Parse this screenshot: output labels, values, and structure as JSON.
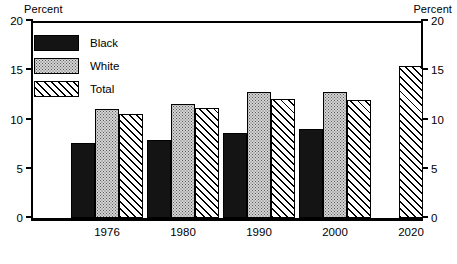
{
  "axis": {
    "left_caption": "Percent",
    "right_caption": "Percent",
    "ticks": [
      "0",
      "5",
      "10",
      "15",
      "20"
    ]
  },
  "legend": {
    "items": [
      {
        "label": "Black",
        "swatch": "solid-black-swatch"
      },
      {
        "label": "White",
        "swatch": "stippled-white-swatch"
      },
      {
        "label": "Total",
        "swatch": "diagonal-hatch-swatch"
      }
    ]
  },
  "chart_data": {
    "type": "bar",
    "title": "",
    "xlabel": "",
    "ylabel": "Percent",
    "ylim": [
      0,
      20
    ],
    "yticks": [
      0,
      5,
      10,
      15,
      20
    ],
    "grid": false,
    "legend_position": "top-left",
    "categories": [
      "1976",
      "1980",
      "1990",
      "2000",
      "2020"
    ],
    "series": [
      {
        "name": "Black",
        "values": [
          7.6,
          7.9,
          8.6,
          9.0,
          null
        ]
      },
      {
        "name": "White",
        "values": [
          11.1,
          11.6,
          12.8,
          12.8,
          null
        ]
      },
      {
        "name": "Total",
        "values": [
          10.6,
          11.2,
          12.1,
          12.0,
          15.4
        ]
      }
    ]
  }
}
